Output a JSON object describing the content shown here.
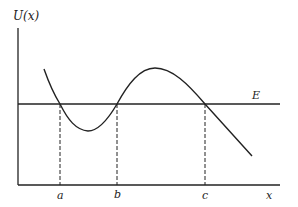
{
  "figure": {
    "y_axis_label": "U(x)",
    "x_axis_label": "x",
    "energy_label": "E",
    "turning_points": [
      {
        "label": "a"
      },
      {
        "label": "b"
      },
      {
        "label": "c"
      }
    ],
    "colors": {
      "line": "#222222",
      "background": "#ffffff"
    }
  }
}
